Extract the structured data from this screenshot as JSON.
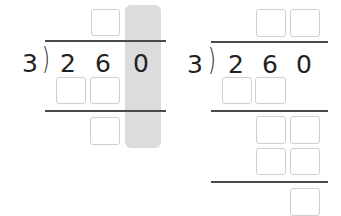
{
  "problems": [
    {
      "id": "left",
      "divisor": "3",
      "dividend_digits": [
        "2",
        "6",
        "0"
      ],
      "highlighted_column": 2,
      "quotient_boxes": 1,
      "step_rows": [
        {
          "boxes": 2
        },
        {
          "boxes": 1
        }
      ]
    },
    {
      "id": "right",
      "divisor": "3",
      "dividend_digits": [
        "2",
        "6",
        "0"
      ],
      "quotient_boxes": 2,
      "step_rows": [
        {
          "boxes": 2
        },
        {
          "boxes": 2
        },
        {
          "boxes": 2
        },
        {
          "boxes": 1
        }
      ]
    }
  ],
  "colors": {
    "highlight": "#dcdcdc",
    "box_border": "#cfcfcf",
    "rule": "#4a4a4a",
    "text": "#222222"
  }
}
